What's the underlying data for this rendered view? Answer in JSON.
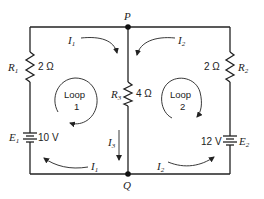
{
  "nodes": {
    "top": "P",
    "bottom": "Q"
  },
  "resistors": [
    {
      "name": "R",
      "sub": "1",
      "value": "2 Ω"
    },
    {
      "name": "R",
      "sub": "2",
      "value": "2 Ω"
    },
    {
      "name": "R",
      "sub": "3",
      "value": "4 Ω"
    }
  ],
  "batteries": [
    {
      "name": "E",
      "sub": "1",
      "value": "10 V"
    },
    {
      "name": "E",
      "sub": "2",
      "value": "12 V"
    }
  ],
  "currents": {
    "i1_top": {
      "name": "I",
      "sub": "1"
    },
    "i2_top": {
      "name": "I",
      "sub": "2"
    },
    "i3": {
      "name": "I",
      "sub": "3"
    },
    "i1_bottom": {
      "name": "I",
      "sub": "1"
    },
    "i2_bottom": {
      "name": "I",
      "sub": "2"
    }
  },
  "loops": [
    {
      "label": "Loop",
      "number": "1"
    },
    {
      "label": "Loop",
      "number": "2"
    }
  ]
}
